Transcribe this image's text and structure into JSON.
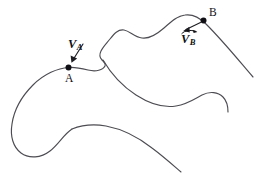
{
  "figure": {
    "kind": "kinematics-path-diagram",
    "background_color": "#ffffff",
    "path_color": "#4c4c52",
    "ink_color": "#101014",
    "points": [
      {
        "id": "A",
        "label": "A",
        "label_x": 65,
        "label_y": 73,
        "dot_x": 68.5,
        "dot_y": 67.5,
        "dot_r": 3.0
      },
      {
        "id": "B",
        "label": "B",
        "label_x": 209,
        "label_y": 7,
        "dot_x": 203.5,
        "dot_y": 20.5,
        "dot_r": 3.0
      }
    ],
    "vectors": [
      {
        "id": "VA",
        "letter": "V",
        "subscript": "A",
        "label_x": 68,
        "label_y": 38,
        "has_accent": false,
        "tail_x": 83.0,
        "tail_y": 44.0,
        "tip_x": 71.5,
        "tip_y": 62.0
      },
      {
        "id": "VB",
        "letter": "V",
        "subscript": "B",
        "label_x": 181,
        "label_y": 33,
        "has_accent": true,
        "tail_x": 200.0,
        "tail_y": 22.5,
        "tip_x": 184.0,
        "tip_y": 30.5
      }
    ],
    "curves": [
      {
        "id": "main-path",
        "name": "upper-trajectory-curve",
        "d": "M 253 77 C 240 62 224 42 206 24 C 199 17 192 14 185 15 C 176 16 170 23 164 28 C 156 35 149 39 142 38 C 134 37 130 31 124 30 C 118 29 114 34 110 39 C 106 44 103 47 101 51 C 99 55 100 58 102 60 C 104 62 106 63 105 66 C 103 70 96 72 88 70 C 80 68 74 67 68.5 67.5 C 58 68 44 74 33 85 C 22 96 14 110 12 124 C 10 136 13 147 21 153 C 29 159 41 158 50 151 C 59 144 64 134 72 129"
      },
      {
        "id": "branch-path",
        "name": "descending-branch-curve",
        "d": "M 103 60 C 110 72 122 86 136 95 C 150 104 164 108 176 106 C 188 104 196 98 202 95 C 210 91 218 92 223 97 C 227 101 228 106 228 112"
      },
      {
        "id": "lower-path",
        "name": "lower-boundary-curve",
        "d": "M 72 129 C 82 125 94 124 106 126 C 122 129 138 137 152 148 C 164 157 174 166 181 172"
      }
    ]
  }
}
